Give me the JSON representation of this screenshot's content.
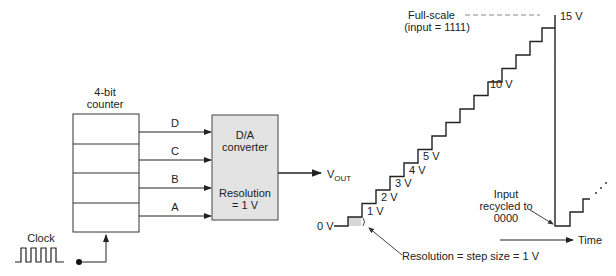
{
  "counter": {
    "title_line1": "4-bit",
    "title_line2": "counter"
  },
  "bits": [
    {
      "label": "D"
    },
    {
      "label": "C"
    },
    {
      "label": "B"
    },
    {
      "label": "A"
    }
  ],
  "clock": {
    "label": "Clock"
  },
  "dac": {
    "line1": "D/A",
    "line2": "converter",
    "line3": "Resolution",
    "line4": "= 1 V",
    "fill": "#e3e3e3"
  },
  "output": {
    "label_main": "V",
    "label_sub": "OUT"
  },
  "staircase": {
    "zero_label": "0 V",
    "step_labels": [
      "1 V",
      "2 V",
      "3 V",
      "4 V",
      "5 V",
      "10 V",
      "15 V"
    ],
    "full_scale_line1": "Full-scale",
    "full_scale_line2": "(input = 1111)",
    "recycle_line1": "Input",
    "recycle_line2": "recycled to",
    "recycle_line3": "0000",
    "resolution_note": "Resolution = step size = 1 V",
    "time_label": "Time",
    "steps": 15,
    "step_volts": 1
  }
}
